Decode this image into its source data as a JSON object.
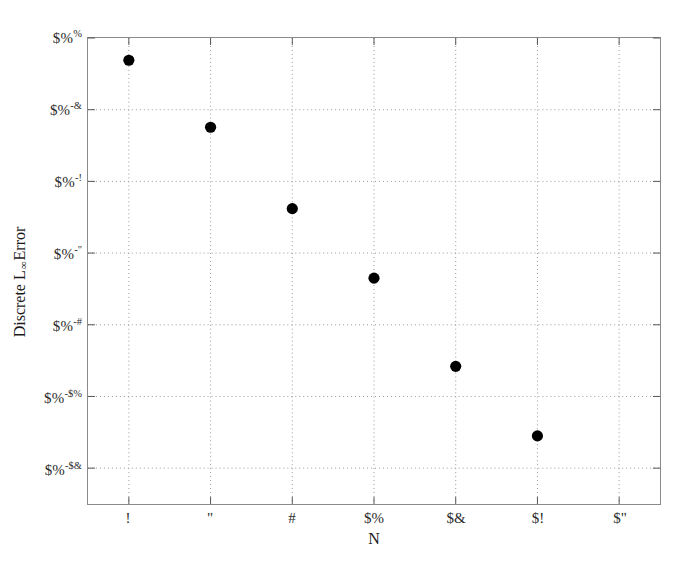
{
  "chart_data": {
    "type": "scatter",
    "title": "",
    "xlabel": "N",
    "ylabel": "Discrete L∞ Error",
    "grid": true,
    "legend": null,
    "yscale": "log",
    "xlim": [
      1,
      15
    ],
    "ylim": [
      -13,
      0
    ],
    "note": "Tick labels render as corrupted font-substituted glyphs in the source image; the literal glyph strings are preserved below.",
    "x_ticks": [
      {
        "value": 2,
        "label": "!"
      },
      {
        "value": 4,
        "label": "\""
      },
      {
        "value": 6,
        "label": "#"
      },
      {
        "value": 8,
        "label": "$%"
      },
      {
        "value": 10,
        "label": "$&"
      },
      {
        "value": 12,
        "label": "$!"
      },
      {
        "value": 14,
        "label": "$\""
      }
    ],
    "y_ticks": [
      {
        "exponent": 0,
        "base": "$%",
        "sup": "%"
      },
      {
        "exponent": -2,
        "base": "$%",
        "sup": "-&"
      },
      {
        "exponent": -4,
        "base": "$%",
        "sup": "-!"
      },
      {
        "exponent": -6,
        "base": "$%",
        "sup": "-\""
      },
      {
        "exponent": -8,
        "base": "$%",
        "sup": "-#"
      },
      {
        "exponent": -10,
        "base": "$%",
        "sup": "-$%"
      },
      {
        "exponent": -12,
        "base": "$%",
        "sup": "-$&"
      }
    ],
    "series": [
      {
        "name": "Discrete L-infinity error",
        "marker": "filled-circle",
        "color": "#000000",
        "points": [
          {
            "x": 2,
            "y_exponent": -0.62
          },
          {
            "x": 4,
            "y_exponent": -2.49
          },
          {
            "x": 6,
            "y_exponent": -4.76
          },
          {
            "x": 8,
            "y_exponent": -6.7
          },
          {
            "x": 10,
            "y_exponent": -9.16
          },
          {
            "x": 12,
            "y_exponent": -11.1
          }
        ]
      }
    ]
  },
  "axes": {
    "x_title": "N",
    "y_title_prefix": "Discrete L",
    "y_title_sub": "∞",
    "y_title_suffix": " Error"
  },
  "colors": {
    "marker": "#000000",
    "axis_border": "#8a8a8a",
    "gridline": "#9a9a9a",
    "background": "#ffffff",
    "text": "#1a1a1a"
  }
}
